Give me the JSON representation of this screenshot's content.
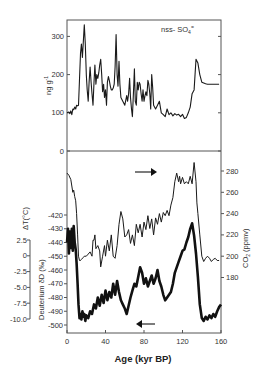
{
  "chart_data": [
    {
      "type": "line",
      "panel": "top",
      "title": "",
      "annotation": "nss- SO4=",
      "series": [
        {
          "name": "nss- SO4=",
          "x": [
            0,
            2,
            3,
            4,
            5,
            6,
            7,
            8,
            9,
            10,
            11,
            12,
            14,
            15,
            16,
            17,
            18,
            19,
            20,
            21,
            22,
            23,
            24,
            25,
            26,
            27,
            28,
            29,
            30,
            31,
            32,
            33,
            34,
            35,
            36,
            37,
            38,
            39,
            40,
            41,
            42,
            43,
            44,
            45,
            46,
            47,
            48,
            49,
            50,
            51,
            52,
            53,
            54,
            55,
            56,
            58,
            60,
            62,
            63,
            64,
            65,
            66,
            67,
            68,
            69,
            70,
            71,
            72,
            73,
            74,
            75,
            76,
            77,
            78,
            79,
            80,
            81,
            82,
            83,
            84,
            85,
            86,
            87,
            88,
            89,
            90,
            92,
            94,
            96,
            98,
            100,
            102,
            104,
            106,
            108,
            110,
            112,
            114,
            116,
            118,
            120,
            122,
            124,
            126,
            128,
            130,
            132,
            134,
            136,
            138,
            140,
            142,
            144,
            146,
            148,
            150,
            152,
            154,
            156,
            158
          ],
          "values": [
            100,
            102,
            98,
            105,
            95,
            110,
            108,
            115,
            110,
            120,
            118,
            120,
            255,
            280,
            245,
            290,
            330,
            280,
            200,
            160,
            130,
            180,
            220,
            180,
            150,
            120,
            180,
            225,
            175,
            200,
            190,
            205,
            225,
            240,
            200,
            155,
            175,
            140,
            160,
            120,
            180,
            195,
            185,
            170,
            160,
            160,
            165,
            175,
            220,
            305,
            200,
            170,
            235,
            175,
            140,
            130,
            120,
            145,
            130,
            150,
            190,
            140,
            110,
            90,
            150,
            215,
            130,
            120,
            180,
            160,
            180,
            175,
            150,
            130,
            160,
            130,
            145,
            155,
            145,
            185,
            175,
            150,
            110,
            200,
            165,
            120,
            110,
            120,
            130,
            100,
            95,
            90,
            110,
            95,
            100,
            92,
            98,
            94,
            96,
            90,
            96,
            85,
            88,
            100,
            115,
            150,
            160,
            240,
            230,
            200,
            180,
            178,
            176,
            175,
            175,
            175,
            175,
            175,
            175,
            175
          ],
          "stroke_width": 1.1
        }
      ],
      "xlabel": "",
      "ylabel": "ng g-1",
      "xlim": [
        0,
        160
      ],
      "ylim": [
        0,
        340
      ],
      "yticks": [
        0,
        100,
        200,
        300
      ],
      "grid": false
    },
    {
      "type": "line",
      "panel": "bottom",
      "series": [
        {
          "name": "CO2 (ppmv)",
          "axis": "right",
          "x": [
            0,
            2,
            4,
            6,
            7,
            8,
            9,
            10,
            11,
            12,
            13,
            14,
            15,
            17,
            18,
            20,
            22,
            24,
            26,
            27,
            28,
            29,
            30,
            32,
            34,
            35,
            37,
            39,
            40,
            42,
            44,
            46,
            48,
            50,
            52,
            54,
            56,
            58,
            60,
            62,
            64,
            66,
            68,
            70,
            72,
            74,
            76,
            78,
            80,
            82,
            84,
            86,
            88,
            90,
            92,
            94,
            96,
            98,
            100,
            102,
            104,
            106,
            108,
            110,
            112,
            114,
            116,
            117,
            118,
            120,
            122,
            124,
            126,
            128,
            130,
            132,
            134,
            135,
            136,
            138,
            140,
            142,
            144,
            146,
            148,
            150,
            152,
            154,
            156,
            158
          ],
          "values": [
            278,
            276,
            272,
            260,
            262,
            256,
            252,
            240,
            220,
            200,
            196,
            196,
            197,
            199,
            200,
            200,
            202,
            204,
            200,
            215,
            215,
            220,
            207,
            210,
            205,
            190,
            200,
            210,
            200,
            215,
            205,
            220,
            200,
            198,
            210,
            230,
            242,
            235,
            218,
            220,
            225,
            212,
            220,
            210,
            230,
            222,
            230,
            218,
            232,
            225,
            238,
            226,
            235,
            220,
            236,
            230,
            240,
            232,
            241,
            238,
            243,
            238,
            248,
            255,
            270,
            278,
            270,
            275,
            268,
            274,
            268,
            270,
            268,
            275,
            268,
            288,
            270,
            250,
            240,
            220,
            200,
            195,
            198,
            200,
            198,
            195,
            197,
            198,
            196,
            196
          ],
          "stroke_width": 1.0
        },
        {
          "name": "Deuterium δD (‰)",
          "axis": "left",
          "x": [
            0,
            1,
            2,
            3,
            4,
            5,
            6,
            7,
            8,
            9,
            10,
            11,
            12,
            13,
            14,
            15,
            16,
            17,
            18,
            19,
            20,
            22,
            24,
            26,
            28,
            30,
            32,
            34,
            36,
            38,
            40,
            42,
            44,
            46,
            48,
            50,
            52,
            54,
            56,
            58,
            60,
            62,
            64,
            66,
            68,
            70,
            72,
            74,
            76,
            78,
            80,
            82,
            84,
            86,
            88,
            90,
            92,
            94,
            96,
            98,
            100,
            102,
            104,
            106,
            108,
            110,
            112,
            114,
            116,
            118,
            120,
            122,
            124,
            126,
            128,
            130,
            132,
            134,
            136,
            138,
            140,
            142,
            144,
            146,
            148,
            150,
            152,
            154,
            156,
            158,
            160
          ],
          "values": [
            -440,
            -430,
            -448,
            -432,
            -444,
            -430,
            -446,
            -428,
            -440,
            -445,
            -455,
            -470,
            -485,
            -495,
            -492,
            -496,
            -490,
            -494,
            -492,
            -497,
            -493,
            -495,
            -490,
            -492,
            -485,
            -488,
            -480,
            -486,
            -478,
            -484,
            -475,
            -482,
            -476,
            -480,
            -470,
            -478,
            -468,
            -476,
            -482,
            -485,
            -488,
            -492,
            -486,
            -480,
            -475,
            -470,
            -472,
            -465,
            -458,
            -462,
            -470,
            -466,
            -472,
            -468,
            -464,
            -470,
            -466,
            -460,
            -468,
            -472,
            -478,
            -482,
            -480,
            -478,
            -476,
            -470,
            -462,
            -458,
            -454,
            -450,
            -446,
            -445,
            -440,
            -436,
            -430,
            -426,
            -435,
            -448,
            -465,
            -485,
            -495,
            -497,
            -494,
            -496,
            -493,
            -495,
            -492,
            -494,
            -490,
            -487,
            -485
          ],
          "stroke_width": 2.6
        }
      ],
      "left_axis_outer": {
        "label": "ΔT(°C)",
        "ticks": [
          2.5,
          0,
          -2.5,
          -5.0,
          -7.5,
          -10.0
        ],
        "tick_labels": [
          "2.5",
          "0",
          "-2.5",
          "-5.0",
          "-7.5",
          "-10.0"
        ]
      },
      "left_axis_inner": {
        "label": "Deuterium δD (‰)",
        "ticks": [
          -420,
          -430,
          -440,
          -450,
          -460,
          -470,
          -480,
          -490,
          -500
        ],
        "ylim": [
          -508,
          -420
        ]
      },
      "right_axis": {
        "label": "CO2 (ppmv)",
        "ticks": [
          180,
          200,
          220,
          240,
          260,
          280
        ],
        "ylim": [
          160,
          300
        ]
      },
      "annotations": [
        {
          "type": "arrow",
          "direction": "right",
          "refers_to": "CO2 (ppmv)",
          "x_approx": 80,
          "level_approx": 280
        },
        {
          "type": "arrow",
          "direction": "left",
          "refers_to": "Deuterium δD (‰)",
          "x_approx": 80,
          "level_approx": -502
        }
      ],
      "xlabel": "Age (kyr BP)",
      "xlim": [
        0,
        160
      ],
      "xticks": [
        0,
        40,
        80,
        120,
        160
      ],
      "grid": false
    }
  ],
  "labels": {
    "sulfate_annotation_main": "nss- SO",
    "sulfate_annotation_sub": "4",
    "sulfate_annotation_sup": "=",
    "top_ylabel_main": "ng g",
    "top_ylabel_sup": "-1",
    "dT_label": "ΔT(°C)",
    "deuterium_label": "Deuterium  δD (‰)",
    "co2_label_main": "CO",
    "co2_label_sub": "2",
    "co2_label_rest": " (ppmv)",
    "xlabel": "Age (kyr BP)"
  },
  "colors": {
    "line": "#1a1a1a",
    "frame": "#555555",
    "text": "#333333",
    "background": "#ffffff"
  }
}
